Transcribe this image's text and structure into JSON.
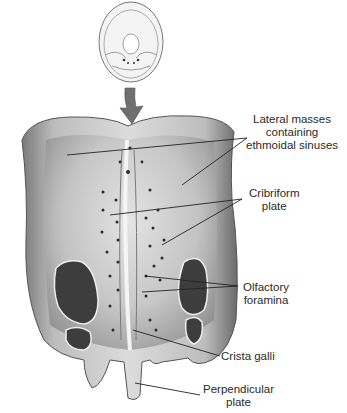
{
  "figure": {
    "orientation_inset": "skull-superior-view-icon",
    "labels": [
      {
        "id": "lateral-masses",
        "lines": [
          "Lateral masses",
          "containing",
          "ethmoidal sinuses"
        ]
      },
      {
        "id": "cribriform-plate",
        "lines": [
          "Cribriform",
          "plate"
        ]
      },
      {
        "id": "olfactory-foramina",
        "lines": [
          "Olfactory",
          "foramina"
        ]
      },
      {
        "id": "crista-galli",
        "lines": [
          "Crista galli"
        ]
      },
      {
        "id": "perpendicular-plate",
        "lines": [
          "Perpendicular",
          "plate"
        ]
      }
    ],
    "colors": {
      "bone_light": "#d9d9d9",
      "bone_mid": "#a8a8a8",
      "bone_dark": "#5e5e5e",
      "cavity": "#3a3a3a",
      "arrow": "#6f6f6f",
      "leader_line": "#222222"
    }
  }
}
